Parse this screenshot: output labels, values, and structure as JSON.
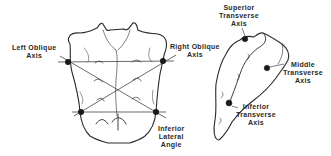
{
  "diagram": {
    "colors": {
      "line": "#2a2a2a",
      "dot": "#1a1a1a",
      "background": "#ffffff"
    },
    "posterior_view": {
      "labels": {
        "left_oblique": [
          "Left Oblique",
          "Axis"
        ],
        "right_oblique": [
          "Right Oblique",
          "Axis"
        ],
        "inferior_lateral_angle": [
          "Inferior",
          "Lateral",
          "Angle"
        ]
      }
    },
    "lateral_view": {
      "labels": {
        "superior_transverse": [
          "Superior",
          "Transverse",
          "Axis"
        ],
        "middle_transverse": [
          "Middle",
          "Transverse",
          "Axis"
        ],
        "inferior_transverse": [
          "Inferior",
          "Transverse",
          "Axis"
        ]
      }
    }
  }
}
